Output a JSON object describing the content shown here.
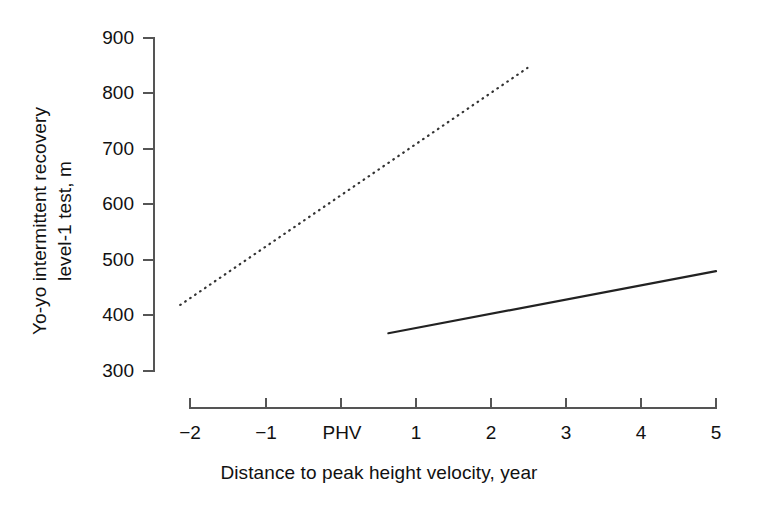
{
  "chart_data": {
    "type": "line",
    "title": "",
    "xlabel": "Distance to peak height velocity, year",
    "ylabel": "Yo-yo intermittent recovery\nlevel-1 test, m",
    "xlim": [
      -2.3,
      5.0
    ],
    "ylim": [
      300,
      900
    ],
    "grid": false,
    "legend": "none",
    "x_tick_values": [
      -2,
      -1,
      0,
      1,
      2,
      3,
      4,
      5
    ],
    "x_tick_labels": [
      "−2",
      "−1",
      "PHV",
      "1",
      "2",
      "3",
      "4",
      "5"
    ],
    "y_tick_values": [
      300,
      400,
      500,
      600,
      700,
      800,
      900
    ],
    "y_tick_labels": [
      "300",
      "400",
      "500",
      "600",
      "700",
      "800",
      "900"
    ],
    "series": [
      {
        "name": "dotted-trend",
        "style": "dotted",
        "color": "#333333",
        "x": [
          -2.13,
          2.49
        ],
        "values": [
          419,
          846
        ]
      },
      {
        "name": "solid-trend",
        "style": "solid",
        "color": "#222222",
        "x": [
          0.64,
          5.0
        ],
        "values": [
          368,
          480
        ]
      }
    ],
    "axis_color": "#555555"
  },
  "axes": {
    "y_title": "Yo-yo intermittent recovery\nlevel-1 test, m",
    "x_title": "Distance to peak height velocity, year"
  }
}
